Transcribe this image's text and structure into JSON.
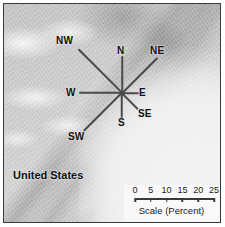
{
  "figure": {
    "type": "wind-rose-on-map",
    "place_label": "United States"
  },
  "compass": {
    "center": {
      "x": 122,
      "y": 93
    },
    "rays": [
      {
        "name": "NW",
        "label": "NW",
        "angle_deg": 225,
        "length_px": 62,
        "label_x": 56,
        "label_y": 36
      },
      {
        "name": "N",
        "label": "N",
        "angle_deg": 270,
        "length_px": 37,
        "label_x": 117,
        "label_y": 46
      },
      {
        "name": "NE",
        "label": "NE",
        "angle_deg": 315,
        "length_px": 50,
        "label_x": 150,
        "label_y": 46
      },
      {
        "name": "E",
        "label": "E",
        "angle_deg": 0,
        "length_px": 17,
        "label_x": 139,
        "label_y": 88
      },
      {
        "name": "SE",
        "label": "SE",
        "angle_deg": 45,
        "length_px": 23,
        "label_x": 138,
        "label_y": 109
      },
      {
        "name": "S",
        "label": "S",
        "angle_deg": 90,
        "length_px": 26,
        "label_x": 118,
        "label_y": 118
      },
      {
        "name": "SW",
        "label": "SW",
        "angle_deg": 135,
        "length_px": 54,
        "label_x": 68,
        "label_y": 132
      },
      {
        "name": "W",
        "label": "W",
        "angle_deg": 180,
        "length_px": 43,
        "label_x": 66,
        "label_y": 88
      }
    ]
  },
  "chart_data": {
    "type": "bar",
    "title": "Scale (Percent)",
    "xlabel": "Scale (Percent)",
    "ylabel": "",
    "categories": [
      "NW",
      "N",
      "NE",
      "E",
      "SE",
      "S",
      "SW",
      "W"
    ],
    "values": [
      25,
      15,
      20,
      7,
      9,
      11,
      22,
      17
    ],
    "ylim": [
      0,
      25
    ],
    "grid": false,
    "legend": "none",
    "note": "Wind-rose ray lengths read against the 0-25 percent scale bar"
  },
  "scale": {
    "caption": "Scale (Percent)",
    "ticks": [
      {
        "label": "0",
        "value": 0
      },
      {
        "label": "5",
        "value": 5
      },
      {
        "label": "10",
        "value": 10
      },
      {
        "label": "15",
        "value": 15
      },
      {
        "label": "20",
        "value": 20
      },
      {
        "label": "25",
        "value": 25
      }
    ],
    "min": 0,
    "max": 25
  },
  "colors": {
    "frame": "#3a3a3a",
    "ray": "#4a4a4a",
    "label": "#111111",
    "land": "#cfcfcf",
    "ocean": "#f2f2f2"
  }
}
